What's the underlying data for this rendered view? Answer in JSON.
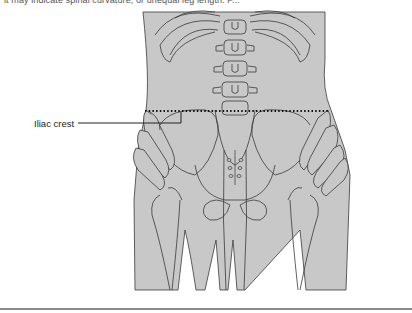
{
  "page": {
    "partial_top_text": "it may indicate spinal curvature, or unequal leg length. F...",
    "figure": {
      "subject": "posterior view of lower back and pelvis showing hands palpating the iliac crests",
      "labels": [
        {
          "text": "Iliac crest"
        }
      ],
      "colors": {
        "body_fill": "#c8c8c8",
        "outline": "#3a3a3a",
        "dotted_line": "#111111"
      }
    }
  }
}
